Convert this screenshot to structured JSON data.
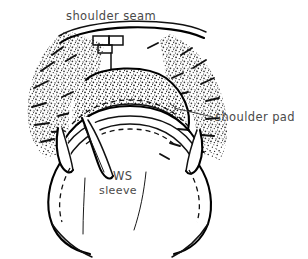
{
  "figure": {
    "background_color": "#ffffff",
    "ink_color": "#111111",
    "label_color": "#4a4a4a",
    "width": 308,
    "height": 259
  },
  "labels": {
    "shoulder_seam": "shoulder seam",
    "shoulder_pad": "shoulder pad",
    "ws": "WS",
    "sleeve": "sleeve"
  },
  "icons": {
    "seam_notch": "seam-notch-icon",
    "leader_line": "leader-line-icon",
    "stipple_texture": "stipple-texture-icon",
    "hatch_marks": "radiating-hatch-icon"
  }
}
